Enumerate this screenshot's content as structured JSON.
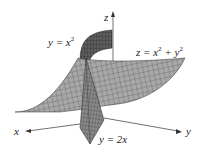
{
  "figure": {
    "axes": {
      "x_label": "x",
      "y_label": "y",
      "z_label": "z"
    },
    "labels": {
      "cylinder": "y = x",
      "cylinder_exp": "2",
      "surface_prefix": "z = x",
      "surface_exp1": "2",
      "surface_mid": " + y",
      "surface_exp2": "2",
      "plane": "y = 2x"
    },
    "colors": {
      "surface": "#a9a9a9",
      "surface_dark": "#6e6e6e",
      "grid": "#3a3a3a",
      "axis": "#333333",
      "background": "#ffffff"
    }
  }
}
